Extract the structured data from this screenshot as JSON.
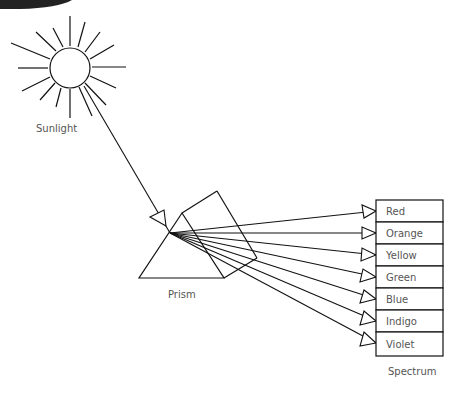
{
  "diagram": {
    "labels": {
      "sun": "Sunlight",
      "prism": "Prism",
      "spectrum": "Spectrum"
    },
    "spectrum_bands": [
      {
        "label": "Red"
      },
      {
        "label": "Orange"
      },
      {
        "label": "Yellow"
      },
      {
        "label": "Green"
      },
      {
        "label": "Blue"
      },
      {
        "label": "Indigo"
      },
      {
        "label": "Violet"
      }
    ],
    "colors": {
      "stroke": "#111111",
      "text": "#555555",
      "background": "#ffffff",
      "corner_shape": "#222222"
    }
  }
}
